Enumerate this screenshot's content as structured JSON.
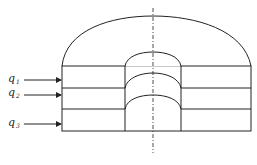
{
  "diagram": {
    "title": "",
    "flows": [
      {
        "label": "q",
        "subscript": "1"
      },
      {
        "label": "q",
        "subscript": "2"
      },
      {
        "label": "q",
        "subscript": "3"
      }
    ],
    "colors": {
      "stroke": "#222222",
      "background": "#ffffff"
    }
  }
}
